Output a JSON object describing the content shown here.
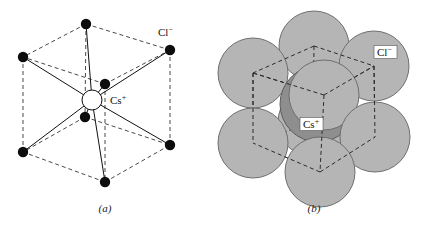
{
  "figure": {
    "title_visible": false,
    "background_color": "#ffffff",
    "panels": [
      {
        "id": "a",
        "caption": "(a)",
        "caption_pos": {
          "x": 105,
          "y": 212
        },
        "type": "ball-and-stick-unit-cell",
        "labels": [
          {
            "name": "chloride-label",
            "text": "Cl",
            "superscript": "−",
            "x": 158,
            "y": 36
          },
          {
            "name": "cesium-label",
            "text": "Cs",
            "superscript": "+",
            "x": 110,
            "y": 104
          }
        ],
        "center_ion": {
          "name": "Cs+",
          "cx": 92,
          "cy": 100,
          "r": 10,
          "fill": "#ffffff",
          "stroke": "#111111"
        },
        "corner_ion_radius": 5.2,
        "corner_ion_fill": "#0d0d0d",
        "corners": [
          {
            "id": "top-back",
            "x": 86,
            "y": 24,
            "hidden": false
          },
          {
            "id": "top-left",
            "x": 23,
            "y": 57,
            "hidden": false
          },
          {
            "id": "top-right",
            "x": 170,
            "y": 50,
            "hidden": false
          },
          {
            "id": "top-front",
            "x": 105,
            "y": 84,
            "hidden": true
          },
          {
            "id": "bottom-back",
            "x": 85,
            "y": 117,
            "hidden": true
          },
          {
            "id": "bottom-left",
            "x": 23,
            "y": 152,
            "hidden": false
          },
          {
            "id": "bottom-right",
            "x": 170,
            "y": 145,
            "hidden": false
          },
          {
            "id": "bottom-front",
            "x": 105,
            "y": 182,
            "hidden": false
          }
        ],
        "dashed_edges": [
          [
            "top-back",
            "top-left"
          ],
          [
            "top-back",
            "top-right"
          ],
          [
            "top-front",
            "top-left"
          ],
          [
            "top-front",
            "top-right"
          ],
          [
            "bottom-back",
            "bottom-left"
          ],
          [
            "bottom-back",
            "bottom-right"
          ],
          [
            "bottom-front",
            "bottom-left"
          ],
          [
            "bottom-front",
            "bottom-right"
          ],
          [
            "top-back",
            "bottom-back"
          ],
          [
            "top-left",
            "bottom-left"
          ],
          [
            "top-right",
            "bottom-right"
          ],
          [
            "top-front",
            "bottom-front"
          ]
        ],
        "bond_lines_from_center_to": [
          "top-back",
          "top-left",
          "top-right",
          "top-front",
          "bottom-back",
          "bottom-left",
          "bottom-right",
          "bottom-front"
        ],
        "edge_style": {
          "color": "#333333",
          "dash": "4,3",
          "width": 0.9
        },
        "bond_style": {
          "color": "#111111",
          "width": 1.0
        }
      },
      {
        "id": "b",
        "caption": "(b)",
        "caption_pos": {
          "x": 314,
          "y": 212
        },
        "type": "space-filling-unit-cell",
        "labels": [
          {
            "name": "chloride-label",
            "text": "Cl",
            "superscript": "−",
            "x": 377,
            "y": 56,
            "boxed": true
          },
          {
            "name": "cesium-label",
            "text": "Cs",
            "superscript": "+",
            "x": 303,
            "y": 128,
            "boxed": true
          }
        ],
        "chloride_sphere": {
          "fill": "#b5b5b5",
          "stroke": "#6e6e6e",
          "r": 35
        },
        "cesium_sphere": {
          "fill": "#8e8e8e",
          "stroke": "#5a5a5a",
          "r": 38,
          "cx": 318,
          "cy": 104
        },
        "chloride_spheres": [
          {
            "id": "top-back",
            "cx": 314,
            "cy": 46,
            "z": 1
          },
          {
            "id": "top-left",
            "cx": 253,
            "cy": 73,
            "z": 2
          },
          {
            "id": "top-right",
            "cx": 374,
            "cy": 66,
            "z": 2
          },
          {
            "id": "top-front",
            "cx": 324,
            "cy": 95,
            "z": 5
          },
          {
            "id": "bottom-back",
            "cx": 313,
            "cy": 122,
            "z": 0
          },
          {
            "id": "bottom-left",
            "cx": 253,
            "cy": 143,
            "z": 4
          },
          {
            "id": "bottom-right",
            "cx": 375,
            "cy": 137,
            "z": 4
          },
          {
            "id": "bottom-front",
            "cx": 320,
            "cy": 172,
            "z": 5
          }
        ],
        "cell_corners": [
          {
            "id": "top-back",
            "x": 314,
            "y": 46
          },
          {
            "id": "top-left",
            "x": 253,
            "y": 73
          },
          {
            "id": "top-right",
            "x": 374,
            "y": 66
          },
          {
            "id": "top-front",
            "x": 324,
            "y": 95
          },
          {
            "id": "bottom-back",
            "x": 313,
            "y": 122
          },
          {
            "id": "bottom-left",
            "x": 253,
            "y": 143
          },
          {
            "id": "bottom-right",
            "x": 375,
            "y": 137
          },
          {
            "id": "bottom-front",
            "x": 320,
            "y": 172
          }
        ],
        "dashed_edges": [
          [
            "top-back",
            "top-left"
          ],
          [
            "top-back",
            "top-right"
          ],
          [
            "top-front",
            "top-left"
          ],
          [
            "top-front",
            "top-right"
          ],
          [
            "bottom-back",
            "bottom-left"
          ],
          [
            "bottom-back",
            "bottom-right"
          ],
          [
            "bottom-front",
            "bottom-left"
          ],
          [
            "bottom-front",
            "bottom-right"
          ],
          [
            "top-back",
            "bottom-back"
          ],
          [
            "top-left",
            "bottom-left"
          ],
          [
            "top-right",
            "bottom-right"
          ],
          [
            "top-front",
            "bottom-front"
          ]
        ],
        "edge_style": {
          "color": "#2b2b2b",
          "dash": "4,3",
          "width": 1.0
        }
      }
    ]
  },
  "chart_data": {
    "type": "diagram",
    "panels": [
      "(a)",
      "(b)"
    ],
    "species": [
      {
        "label": "Cl−",
        "role": "corner ions",
        "count_per_cell": 8,
        "render_a": "small black dot",
        "render_b": "large light-gray sphere"
      },
      {
        "label": "Cs+",
        "role": "body-center ion",
        "count_per_cell": 1,
        "render_a": "open white circle",
        "render_b": "dark-gray sphere"
      }
    ],
    "coordination_number": 8
  }
}
